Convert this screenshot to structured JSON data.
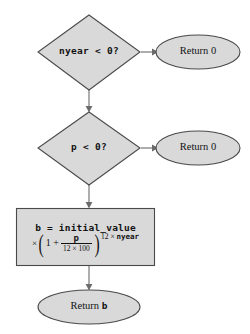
{
  "diagram": {
    "type": "flowchart",
    "style": {
      "shape_fill": "#d9d9d9",
      "shape_border": "#4a4a4a",
      "connector": "#6b6b6b",
      "text": "#121212",
      "background": "#ffffff"
    },
    "nodes": [
      {
        "id": "decision_nyear",
        "shape": "diamond",
        "label": "nyear < 0?"
      },
      {
        "id": "return_zero_nyear",
        "shape": "ellipse",
        "label": "Return 0"
      },
      {
        "id": "decision_p",
        "shape": "diamond",
        "label": "p < 0?"
      },
      {
        "id": "return_zero_p",
        "shape": "ellipse",
        "label": "Return 0"
      },
      {
        "id": "compute_b",
        "shape": "rectangle",
        "formula": {
          "line1": "b = initial_value",
          "times": "×",
          "one_plus": "1 +",
          "numerator": "p",
          "denominator": "12 × 100",
          "exponent_prefix": "12 × ",
          "exponent_var": "nyear"
        }
      },
      {
        "id": "return_b",
        "shape": "ellipse",
        "label_prefix": "Return ",
        "label_var": "b"
      }
    ]
  }
}
